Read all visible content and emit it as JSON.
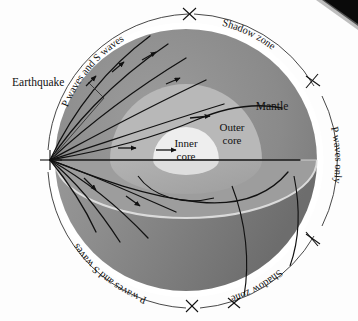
{
  "figure": {
    "type": "cross-section-diagram"
  },
  "labels": {
    "earthquake": "Earthquake",
    "mantle": "Mantle",
    "outer_core_line1": "Outer",
    "outer_core_line2": "core",
    "inner_core_line1": "Inner",
    "inner_core_line2": "core",
    "shadow_zone_top": "Shadow zone",
    "shadow_zone_bottom": "Shadow zone",
    "p_and_s_top": "P waves and S waves",
    "p_and_s_bottom": "P waves and S waves",
    "p_only": "P waves only"
  },
  "colors": {
    "background": "#fdfdfd",
    "mantle": "#8a8a8a",
    "mantle_lower_shadow": "#6f6f6f",
    "mantle_lower_light": "#9a9a9a",
    "outer_core": "#b8b8b8",
    "outer_core_lower": "#a6a6a6",
    "inner_core": "#eeeeee",
    "inner_core_lower": "#dcdcdc",
    "rim": "#ffffff",
    "stroke": "#111111",
    "leader": "#333333",
    "corner_artifact": "#0a0a0a"
  },
  "geometry": {
    "globe_center_x": 186,
    "globe_center_y": 160,
    "globe_radius": 138,
    "focus_x": 50,
    "focus_y": 160,
    "outer_core_radius": 76,
    "inner_core_radius": 33
  },
  "ray_count": 14,
  "arrow_count": 9
}
